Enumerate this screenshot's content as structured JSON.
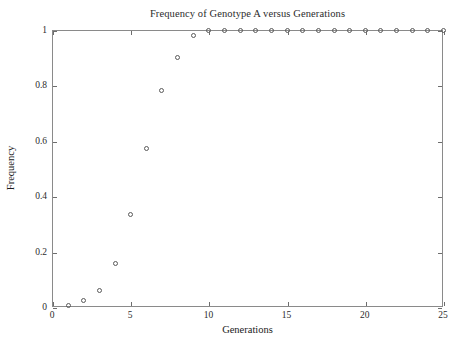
{
  "chart_data": {
    "type": "scatter",
    "title": "Frequency of Genotype A versus Generations",
    "xlabel": "Generations",
    "ylabel": "Frequency",
    "xlim": [
      0,
      25
    ],
    "ylim": [
      0,
      1
    ],
    "grid": false,
    "legend": null,
    "marker": "open-circle",
    "marker_color": "#5a5a5a",
    "axis_color": "#8a8a8a",
    "background": "#ffffff",
    "xticks": [
      0,
      5,
      10,
      15,
      20,
      25
    ],
    "xticklabels": [
      "0",
      "5",
      "10",
      "15",
      "20",
      "25"
    ],
    "yticks": [
      0,
      0.2,
      0.4,
      0.6,
      0.8,
      1
    ],
    "yticklabels": [
      "0",
      "0.2",
      "0.4",
      "0.6",
      "0.8",
      "1"
    ],
    "x": [
      1,
      2,
      3,
      4,
      5,
      6,
      7,
      8,
      9,
      10,
      11,
      12,
      13,
      14,
      15,
      16,
      17,
      18,
      19,
      20,
      21,
      22,
      23,
      24,
      25
    ],
    "values": [
      0.007,
      0.025,
      0.063,
      0.158,
      0.335,
      0.575,
      0.785,
      0.903,
      0.981,
      1.0,
      1.0,
      1.0,
      1.0,
      1.0,
      1.0,
      1.0,
      1.0,
      1.0,
      1.0,
      1.0,
      1.0,
      1.0,
      1.0,
      1.0,
      1.0
    ],
    "series": [
      {
        "name": "Genotype A frequency",
        "values": [
          0.007,
          0.025,
          0.063,
          0.158,
          0.335,
          0.575,
          0.785,
          0.903,
          0.981,
          1.0,
          1.0,
          1.0,
          1.0,
          1.0,
          1.0,
          1.0,
          1.0,
          1.0,
          1.0,
          1.0,
          1.0,
          1.0,
          1.0,
          1.0,
          1.0
        ]
      }
    ]
  }
}
